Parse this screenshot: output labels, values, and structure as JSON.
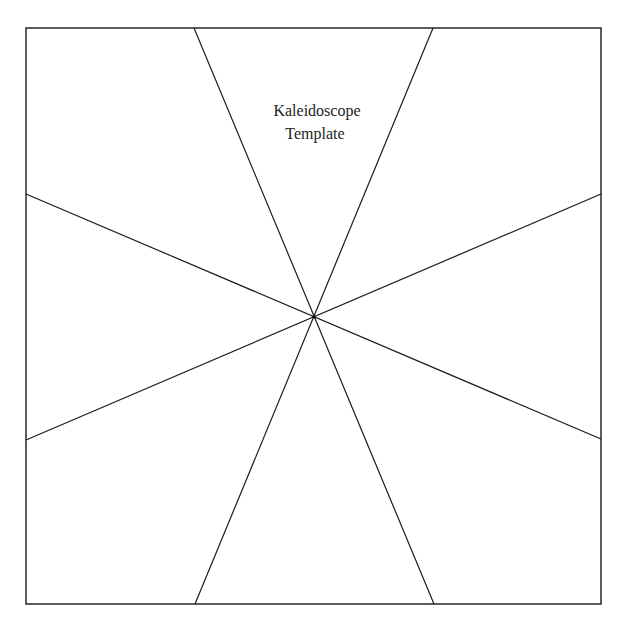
{
  "title": {
    "line1": "Kaleidoscope",
    "line2": "Template"
  },
  "diagram": {
    "type": "kaleidoscope-template",
    "segments": 8,
    "stroke_color": "#1a1a1a",
    "background_color": "#ffffff"
  }
}
